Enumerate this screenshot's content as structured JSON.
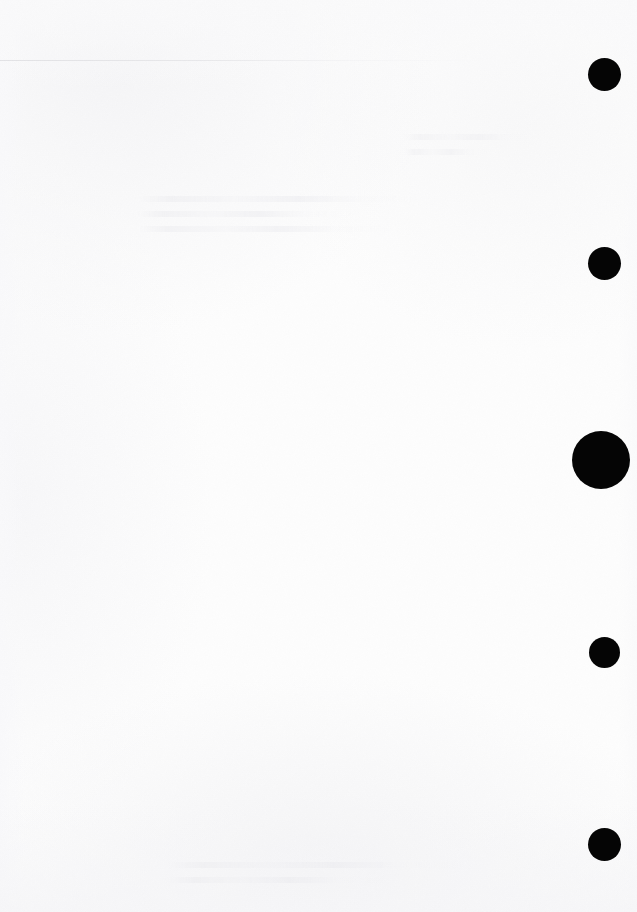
{
  "page": {
    "width": 637,
    "height": 912,
    "background_color": "#fdfdfd"
  },
  "marks": {
    "color": "#050505",
    "count": 5,
    "items": [
      {
        "name": "registration-mark-1",
        "cx": 604,
        "cy": 74,
        "diameter": 33
      },
      {
        "name": "registration-mark-2",
        "cx": 604,
        "cy": 263,
        "diameter": 33
      },
      {
        "name": "registration-mark-3",
        "cx": 601,
        "cy": 460,
        "diameter": 58
      },
      {
        "name": "registration-mark-4",
        "cx": 604,
        "cy": 652,
        "diameter": 31
      },
      {
        "name": "registration-mark-5",
        "cx": 604,
        "cy": 844,
        "diameter": 33
      }
    ]
  },
  "artifacts": {
    "rule": {
      "name": "scan-rule",
      "x": 0,
      "y": 60,
      "width": 486,
      "color": "#d2d2d6"
    },
    "ghosts": [
      {
        "name": "ghost-text-upper",
        "x": 138,
        "y": 196,
        "width": 300,
        "lines": 3,
        "opacity": 0.55
      },
      {
        "name": "ghost-text-header",
        "x": 404,
        "y": 134,
        "width": 150,
        "lines": 2,
        "opacity": 0.4
      },
      {
        "name": "ghost-text-lower",
        "x": 168,
        "y": 862,
        "width": 330,
        "lines": 2,
        "opacity": 0.5
      }
    ]
  }
}
